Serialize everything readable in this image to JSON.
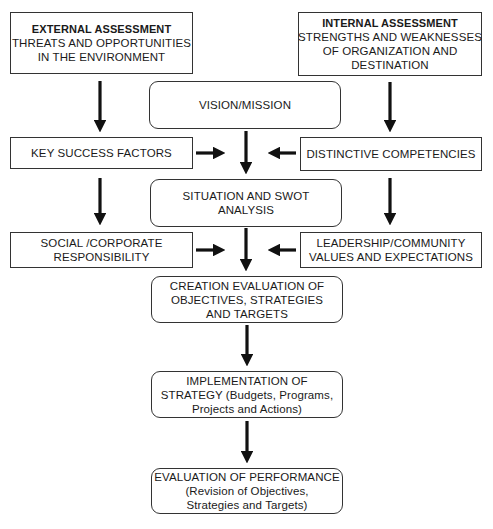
{
  "diagram": {
    "nodes": {
      "external": {
        "heading": "EXTERNAL ASSESSMENT",
        "lines": [
          "THREATS AND OPPORTUNITIES",
          "IN THE ENVIRONMENT"
        ]
      },
      "internal": {
        "heading": "INTERNAL ASSESSMENT",
        "lines": [
          "STRENGTHS AND WEAKNESSES",
          "OF ORGANIZATION AND",
          "DESTINATION"
        ]
      },
      "vision": {
        "lines": [
          "VISION/MISSION"
        ]
      },
      "key_success": {
        "lines": [
          "KEY SUCCESS FACTORS"
        ]
      },
      "distinctive": {
        "lines": [
          "DISTINCTIVE COMPETENCIES"
        ]
      },
      "situation": {
        "lines": [
          "SITUATION AND SWOT",
          "ANALYSIS"
        ]
      },
      "social": {
        "lines": [
          "SOCIAL /CORPORATE",
          "RESPONSIBILITY"
        ]
      },
      "leadership": {
        "lines": [
          "LEADERSHIP/COMMUNITY",
          "VALUES AND EXPECTATIONS"
        ]
      },
      "creation": {
        "lines": [
          "CREATION EVALUATION OF",
          "OBJECTIVES, STRATEGIES",
          "AND TARGETS"
        ]
      },
      "implementation": {
        "lines": [
          "IMPLEMENTATION OF",
          "STRATEGY (Budgets, Programs,",
          "Projects and Actions)"
        ]
      },
      "evaluation": {
        "lines": [
          "EVALUATION OF PERFORMANCE",
          "(Revision of Objectives,",
          "Strategies and Targets)"
        ]
      }
    },
    "edges": [
      {
        "from": "external",
        "to": "key_success"
      },
      {
        "from": "internal",
        "to": "distinctive"
      },
      {
        "from": "vision",
        "to": "situation"
      },
      {
        "from": "key_success",
        "to": "situation"
      },
      {
        "from": "distinctive",
        "to": "situation"
      },
      {
        "from": "key_success",
        "to": "social"
      },
      {
        "from": "distinctive",
        "to": "leadership"
      },
      {
        "from": "situation",
        "to": "creation"
      },
      {
        "from": "social",
        "to": "creation"
      },
      {
        "from": "leadership",
        "to": "creation"
      },
      {
        "from": "creation",
        "to": "implementation"
      },
      {
        "from": "implementation",
        "to": "evaluation"
      }
    ],
    "colors": {
      "line": "#111111",
      "border": "#333333",
      "background": "#ffffff"
    }
  }
}
